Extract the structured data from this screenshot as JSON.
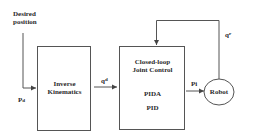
{
  "diagram": {
    "input_label": {
      "line1": "Desired",
      "line2": "position"
    },
    "input_signal": {
      "base": "P",
      "subscript": "d"
    },
    "blocks": [
      {
        "id": "inverse-kinematics",
        "line1": "Inverse",
        "line2": "Kinematics"
      },
      {
        "id": "joint-control",
        "line1": "Closed-loop",
        "line2": "Joint Control",
        "option1": "PIDA",
        "option2": "PID"
      },
      {
        "id": "robot",
        "label": "Robot"
      }
    ],
    "signals": {
      "desired_joints": {
        "base": "q",
        "superscript": "d"
      },
      "control_output": {
        "label": "Pi"
      },
      "feedback": {
        "base": "q",
        "superscript": "r"
      }
    },
    "colors": {
      "line": "#555555",
      "text": "#2a2a2a",
      "background": "#ffffff"
    }
  }
}
